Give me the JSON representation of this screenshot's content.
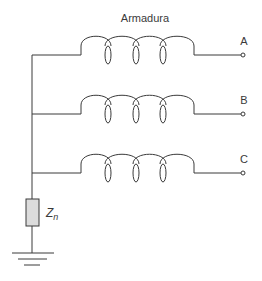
{
  "title": "Armadura",
  "phases": [
    {
      "label": "A"
    },
    {
      "label": "B"
    },
    {
      "label": "C"
    }
  ],
  "impedance": {
    "symbol": "Z",
    "subscript": "n"
  },
  "ground": {
    "icon": "ground-icon"
  },
  "colors": {
    "line": "#3a3a3a",
    "impedance_fill": "#dcdcdc",
    "background": "#ffffff"
  }
}
